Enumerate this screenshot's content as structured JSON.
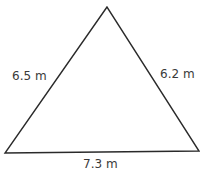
{
  "diagram": {
    "shape": "triangle",
    "stroke_color": "#2a2a2a",
    "vertices": {
      "top": [
        107,
        7
      ],
      "bottom_left": [
        5,
        153
      ],
      "bottom_right": [
        199,
        151
      ]
    },
    "sides": {
      "left": "6.5 m",
      "right": "6.2 m",
      "bottom": "7.3 m"
    }
  }
}
